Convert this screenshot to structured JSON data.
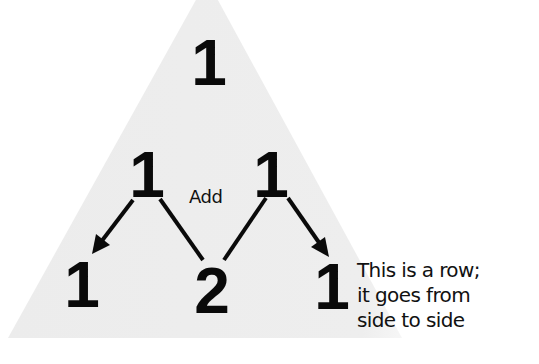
{
  "diagram": {
    "colors": {
      "triangle_fill": "#ececec",
      "ink": "#0a0a0a",
      "background": "#ffffff"
    },
    "rows": [
      {
        "index": 0,
        "values": [
          "1"
        ]
      },
      {
        "index": 1,
        "values": [
          "1",
          "1"
        ]
      },
      {
        "index": 2,
        "values": [
          "1",
          "2",
          "1"
        ]
      }
    ],
    "operation_label": "Add",
    "connectors": [
      {
        "from": "row1-left-1",
        "to": "row2-left-1",
        "type": "arrow"
      },
      {
        "from": "row1-left-1",
        "to": "row2-middle-2",
        "type": "line"
      },
      {
        "from": "row1-right-1",
        "to": "row2-middle-2",
        "type": "line"
      },
      {
        "from": "row1-right-1",
        "to": "row2-right-1",
        "type": "arrow"
      }
    ],
    "caption": {
      "lines": [
        "This is a row;",
        "it goes from",
        "side to side"
      ]
    }
  }
}
